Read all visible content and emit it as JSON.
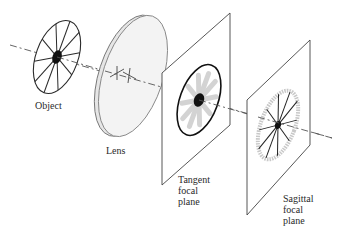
{
  "diagram": {
    "labels": {
      "object": "Object",
      "lens": "Lens",
      "tangent_plane": "Tangent\nfocal\nplane",
      "sagittal_plane": "Sagittal\nfocal\nplane"
    },
    "elements": [
      {
        "id": "object",
        "description": "spoked wheel target with 10 spokes and black center dot"
      },
      {
        "id": "lens",
        "description": "thin convex lens disk shown in perspective"
      },
      {
        "id": "tangent_plane",
        "description": "plane where tangential (circular) lines focus sharply; rim sharp, spokes blurred"
      },
      {
        "id": "sagittal_plane",
        "description": "plane where sagittal (radial) lines focus sharply; spokes sharp, rim blurred"
      },
      {
        "id": "optical_axis",
        "description": "dashed line through all elements"
      }
    ],
    "colors": {
      "line": "#2a2a2a",
      "blur": "#c8c8c8",
      "lens_fill": "#efefef",
      "background": "#ffffff"
    }
  }
}
